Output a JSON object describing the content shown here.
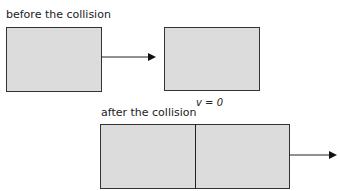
{
  "diagram": {
    "before": {
      "label": "before the collision",
      "blocks": [
        {
          "name": "left-block",
          "moving": true
        },
        {
          "name": "right-block",
          "moving": false
        }
      ],
      "arrow": "velocity-arrow-right"
    },
    "after": {
      "label": "after the collision",
      "velocity_label": "v = 0",
      "blocks": [
        {
          "name": "left-block",
          "velocity": "v = 0"
        },
        {
          "name": "right-block",
          "moving": true
        }
      ],
      "arrow": "velocity-arrow-right"
    },
    "colors": {
      "block_fill": "#dcdcdc",
      "block_border": "#333333",
      "arrow": "#222222"
    }
  }
}
